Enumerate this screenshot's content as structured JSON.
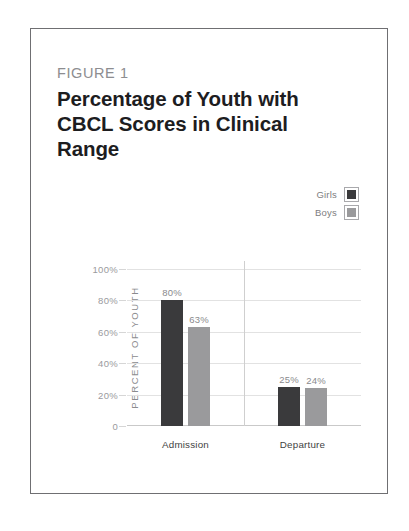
{
  "figure": {
    "eyebrow": "FIGURE 1",
    "title": "Percentage of Youth with CBCL Scores in Clinical Range"
  },
  "chart_data": {
    "type": "bar",
    "title": "Percentage of Youth with CBCL Scores in Clinical Range",
    "xlabel": "",
    "ylabel": "PERCENT OF YOUTH",
    "categories": [
      "Admission",
      "Departure"
    ],
    "series": [
      {
        "name": "Girls",
        "color": "#3a3a3c",
        "values": [
          80,
          25
        ],
        "labels": [
          "80%",
          "63%"
        ]
      },
      {
        "name": "Boys",
        "color": "#9a9a9c",
        "values": [
          63,
          24
        ],
        "labels": [
          "25%",
          "24%"
        ]
      }
    ],
    "bars": [
      {
        "group": "Admission",
        "series": "Girls",
        "value": 80,
        "label": "80%"
      },
      {
        "group": "Admission",
        "series": "Boys",
        "value": 63,
        "label": "63%"
      },
      {
        "group": "Departure",
        "series": "Girls",
        "value": 25,
        "label": "25%"
      },
      {
        "group": "Departure",
        "series": "Boys",
        "value": 24,
        "label": "24%"
      }
    ],
    "ylim": [
      0,
      100
    ],
    "yticks": [
      100,
      80,
      60,
      40,
      20,
      0
    ],
    "ytick_labels": [
      "100%",
      "80%",
      "60%",
      "40%",
      "20%",
      "0"
    ],
    "grid": true,
    "legend_position": "top-right"
  },
  "legend": {
    "items": [
      {
        "label": "Girls",
        "color": "#3a3a3c"
      },
      {
        "label": "Boys",
        "color": "#9a9a9c"
      }
    ]
  }
}
